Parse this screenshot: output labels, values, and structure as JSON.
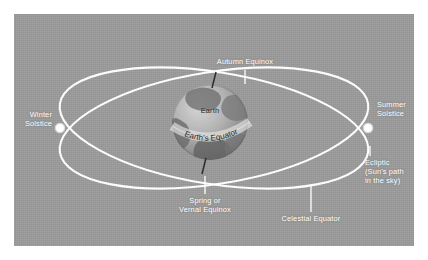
{
  "figure": {
    "panel_background": "#9a9a9a",
    "line_color": "#ffffff",
    "label_color": "#ffffff",
    "globe_label_color": "#2b2b2b"
  },
  "labels": {
    "autumn_equinox": "Autumn Equinox",
    "winter_solstice": "Winter\nSolstice",
    "summer_solstice": "Summer\nSolstice",
    "ecliptic": "Ecliptic\n(Sun's path\nin the sky)",
    "spring_equinox": "Spring or\nVernal Equinox",
    "celestial_equator": "Celestial Equator",
    "earth": "Earth",
    "earth_equator": "Earth's Equator"
  },
  "markers": {
    "winter_solstice_point": "white-dot",
    "summer_solstice_point": "white-dot"
  }
}
